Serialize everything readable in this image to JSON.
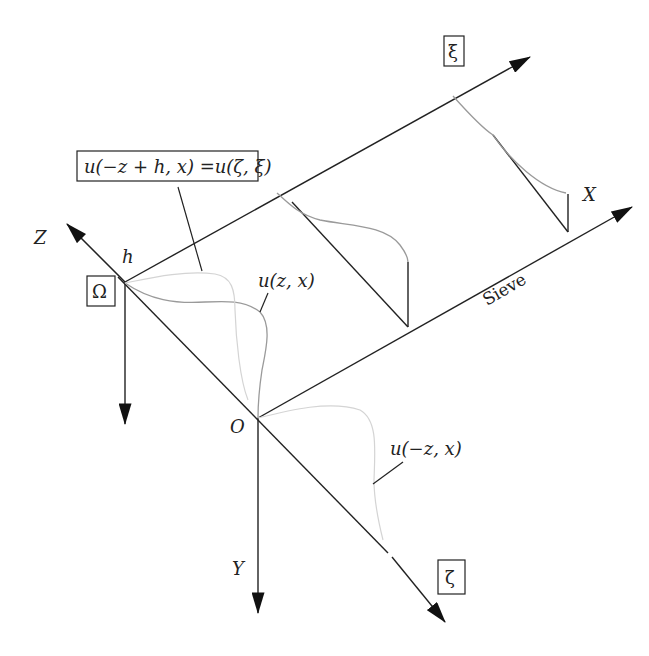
{
  "diagram": {
    "type": "coordinate-transform schematic",
    "axes": {
      "Z": "Z",
      "Y": "Y",
      "X": "X",
      "xi": "ξ",
      "zeta": "ζ"
    },
    "points": {
      "origin": "O",
      "top": "h",
      "omega": "Ω"
    },
    "labels": {
      "equation": "u(−z + h, x) =u(ζ, ξ)",
      "u_zx": "u(z, x)",
      "u_mzx": "u(−z, x)",
      "sieve": "Sieve"
    },
    "colors": {
      "axis": "#222222",
      "curve_main": "#9a9a9a",
      "curve_faint": "#d4d4d4"
    }
  }
}
